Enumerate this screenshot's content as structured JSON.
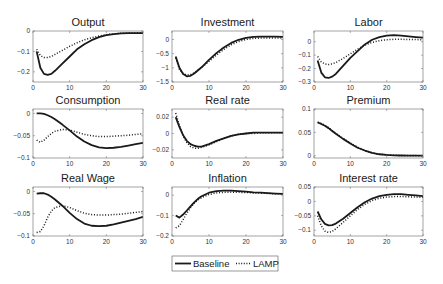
{
  "figure": {
    "legend": {
      "entries": [
        {
          "label": "Baseline",
          "style": "solid"
        },
        {
          "label": "LAMP",
          "style": "dotted"
        }
      ]
    }
  },
  "chart_data": [
    {
      "type": "line",
      "title": "Output",
      "xlabel": "",
      "ylabel": "",
      "xlim": [
        0,
        30
      ],
      "ylim": [
        -0.25,
        0
      ],
      "xticks": [
        0,
        10,
        20,
        30
      ],
      "yticks": [
        0,
        -0.1,
        -0.2
      ],
      "ytick_labels": [
        "0",
        "-0.1",
        "-0.2"
      ],
      "grid": false,
      "x": [
        1,
        2,
        3,
        4,
        5,
        6,
        8,
        10,
        12,
        14,
        16,
        18,
        20,
        22,
        24,
        26,
        28,
        30
      ],
      "series": [
        {
          "name": "Baseline",
          "values": [
            -0.1,
            -0.18,
            -0.21,
            -0.215,
            -0.21,
            -0.195,
            -0.16,
            -0.125,
            -0.09,
            -0.065,
            -0.045,
            -0.03,
            -0.02,
            -0.015,
            -0.012,
            -0.01,
            -0.01,
            -0.01
          ]
        },
        {
          "name": "LAMP",
          "values": [
            -0.09,
            -0.12,
            -0.13,
            -0.13,
            -0.125,
            -0.115,
            -0.095,
            -0.075,
            -0.058,
            -0.043,
            -0.033,
            -0.025,
            -0.018,
            -0.014,
            -0.011,
            -0.01,
            -0.009,
            -0.008
          ]
        }
      ]
    },
    {
      "type": "line",
      "title": "Investment",
      "xlabel": "",
      "ylabel": "",
      "xlim": [
        0,
        30
      ],
      "ylim": [
        -1.5,
        0.3
      ],
      "xticks": [
        0,
        10,
        20,
        30
      ],
      "yticks": [
        0,
        -0.5,
        -1,
        -1.5
      ],
      "ytick_labels": [
        "0",
        "-0.5",
        "-1",
        "-1.5"
      ],
      "grid": false,
      "x": [
        1,
        2,
        3,
        4,
        5,
        6,
        8,
        10,
        12,
        14,
        16,
        18,
        20,
        22,
        24,
        26,
        28,
        30
      ],
      "series": [
        {
          "name": "Baseline",
          "values": [
            -0.6,
            -1.0,
            -1.22,
            -1.3,
            -1.28,
            -1.2,
            -0.98,
            -0.72,
            -0.48,
            -0.28,
            -0.12,
            -0.01,
            0.06,
            0.09,
            0.1,
            0.1,
            0.1,
            0.09
          ]
        },
        {
          "name": "LAMP",
          "values": [
            -0.65,
            -1.05,
            -1.2,
            -1.25,
            -1.24,
            -1.18,
            -0.99,
            -0.77,
            -0.55,
            -0.35,
            -0.19,
            -0.07,
            0.0,
            0.04,
            0.05,
            0.05,
            0.05,
            0.05
          ]
        }
      ]
    },
    {
      "type": "line",
      "title": "Labor",
      "xlabel": "",
      "ylabel": "",
      "xlim": [
        0,
        30
      ],
      "ylim": [
        -0.3,
        0.08
      ],
      "xticks": [
        0,
        10,
        20,
        30
      ],
      "yticks": [
        0,
        -0.1,
        -0.2,
        -0.3
      ],
      "ytick_labels": [
        "0",
        "-0.1",
        "-0.2",
        "-0.3"
      ],
      "grid": false,
      "x": [
        1,
        2,
        3,
        4,
        5,
        6,
        8,
        10,
        12,
        14,
        16,
        18,
        20,
        22,
        24,
        26,
        28,
        30
      ],
      "series": [
        {
          "name": "Baseline",
          "values": [
            -0.14,
            -0.23,
            -0.265,
            -0.27,
            -0.26,
            -0.24,
            -0.18,
            -0.12,
            -0.07,
            -0.02,
            0.015,
            0.035,
            0.045,
            0.05,
            0.045,
            0.04,
            0.035,
            0.03
          ]
        },
        {
          "name": "LAMP",
          "values": [
            -0.11,
            -0.15,
            -0.165,
            -0.17,
            -0.165,
            -0.155,
            -0.125,
            -0.09,
            -0.055,
            -0.025,
            -0.005,
            0.008,
            0.015,
            0.018,
            0.018,
            0.017,
            0.016,
            0.015
          ]
        }
      ]
    },
    {
      "type": "line",
      "title": "Consumption",
      "xlabel": "",
      "ylabel": "",
      "xlim": [
        0,
        30
      ],
      "ylim": [
        -0.1,
        0.01
      ],
      "xticks": [
        0,
        10,
        20,
        30
      ],
      "yticks": [
        0,
        -0.05,
        -0.1
      ],
      "ytick_labels": [
        "0",
        "-0.05",
        "-0.1"
      ],
      "grid": false,
      "x": [
        1,
        2,
        3,
        4,
        5,
        6,
        8,
        10,
        12,
        14,
        16,
        18,
        20,
        22,
        24,
        26,
        28,
        30
      ],
      "series": [
        {
          "name": "Baseline",
          "values": [
            0.0,
            0.0,
            -0.001,
            -0.004,
            -0.008,
            -0.013,
            -0.025,
            -0.038,
            -0.052,
            -0.063,
            -0.071,
            -0.076,
            -0.078,
            -0.077,
            -0.075,
            -0.072,
            -0.069,
            -0.066
          ]
        },
        {
          "name": "LAMP",
          "values": [
            -0.06,
            -0.065,
            -0.06,
            -0.052,
            -0.045,
            -0.04,
            -0.036,
            -0.037,
            -0.042,
            -0.047,
            -0.05,
            -0.052,
            -0.052,
            -0.051,
            -0.05,
            -0.049,
            -0.047,
            -0.046
          ]
        }
      ]
    },
    {
      "type": "line",
      "title": "Real rate",
      "xlabel": "",
      "ylabel": "",
      "xlim": [
        0,
        30
      ],
      "ylim": [
        -0.03,
        0.03
      ],
      "xticks": [
        0,
        10,
        20,
        30
      ],
      "yticks": [
        0.02,
        0,
        -0.02
      ],
      "ytick_labels": [
        "0.02",
        "0",
        "-0.02"
      ],
      "grid": false,
      "x": [
        1,
        2,
        3,
        4,
        5,
        6,
        7,
        8,
        10,
        12,
        14,
        16,
        18,
        20,
        22,
        24,
        26,
        28,
        30
      ],
      "series": [
        {
          "name": "Baseline",
          "values": [
            0.02,
            0.008,
            -0.002,
            -0.009,
            -0.013,
            -0.015,
            -0.016,
            -0.016,
            -0.013,
            -0.009,
            -0.006,
            -0.003,
            -0.001,
            0.0,
            0.001,
            0.001,
            0.001,
            0.001,
            0.001
          ]
        },
        {
          "name": "LAMP",
          "values": [
            0.025,
            0.01,
            -0.003,
            -0.011,
            -0.016,
            -0.018,
            -0.018,
            -0.017,
            -0.014,
            -0.01,
            -0.006,
            -0.003,
            -0.001,
            0.0,
            0.0,
            0.001,
            0.001,
            0.001,
            0.001
          ]
        }
      ]
    },
    {
      "type": "line",
      "title": "Premium",
      "xlabel": "",
      "ylabel": "",
      "xlim": [
        0,
        30
      ],
      "ylim": [
        -0.005,
        0.1
      ],
      "xticks": [
        0,
        10,
        20,
        30
      ],
      "yticks": [
        0.1,
        0.05,
        0
      ],
      "ytick_labels": [
        "0.1",
        "0.05",
        "0"
      ],
      "grid": false,
      "x": [
        1,
        2,
        3,
        4,
        5,
        6,
        8,
        10,
        12,
        14,
        16,
        18,
        20,
        22,
        24,
        26,
        28,
        30
      ],
      "series": [
        {
          "name": "Baseline",
          "values": [
            0.071,
            0.068,
            0.064,
            0.059,
            0.053,
            0.047,
            0.036,
            0.026,
            0.017,
            0.011,
            0.006,
            0.003,
            0.0015,
            0.0008,
            0.0004,
            0.0002,
            0.0001,
            0.0
          ]
        },
        {
          "name": "LAMP",
          "values": [
            0.072,
            0.069,
            0.065,
            0.06,
            0.054,
            0.048,
            0.037,
            0.027,
            0.018,
            0.011,
            0.006,
            0.003,
            0.0015,
            0.0008,
            0.0004,
            0.0002,
            0.0001,
            0.0
          ]
        }
      ]
    },
    {
      "type": "line",
      "title": "Real Wage",
      "xlabel": "",
      "ylabel": "",
      "xlim": [
        0,
        30
      ],
      "ylim": [
        -0.1,
        0.01
      ],
      "xticks": [
        0,
        10,
        20,
        30
      ],
      "yticks": [
        0,
        -0.05,
        -0.1
      ],
      "ytick_labels": [
        "0",
        "-0.05",
        "-0.1"
      ],
      "grid": false,
      "x": [
        1,
        2,
        3,
        4,
        5,
        6,
        8,
        10,
        12,
        14,
        16,
        18,
        20,
        22,
        24,
        26,
        28,
        30
      ],
      "series": [
        {
          "name": "Baseline",
          "values": [
            -0.005,
            -0.004,
            -0.004,
            -0.007,
            -0.012,
            -0.018,
            -0.032,
            -0.048,
            -0.062,
            -0.072,
            -0.077,
            -0.078,
            -0.077,
            -0.074,
            -0.07,
            -0.066,
            -0.062,
            -0.057
          ]
        },
        {
          "name": "LAMP",
          "values": [
            -0.092,
            -0.09,
            -0.077,
            -0.058,
            -0.044,
            -0.036,
            -0.032,
            -0.036,
            -0.043,
            -0.049,
            -0.052,
            -0.053,
            -0.053,
            -0.052,
            -0.051,
            -0.049,
            -0.047,
            -0.045
          ]
        }
      ]
    },
    {
      "type": "line",
      "title": "Inflation",
      "xlabel": "",
      "ylabel": "",
      "xlim": [
        0,
        30
      ],
      "ylim": [
        -0.2,
        0.04
      ],
      "xticks": [
        0,
        10,
        20,
        30
      ],
      "yticks": [
        0,
        -0.1,
        -0.2
      ],
      "ytick_labels": [
        "0",
        "-0.1",
        "-0.2"
      ],
      "grid": false,
      "x": [
        1,
        2,
        3,
        4,
        5,
        6,
        7,
        8,
        10,
        12,
        14,
        16,
        18,
        20,
        22,
        24,
        26,
        28,
        30
      ],
      "series": [
        {
          "name": "Baseline",
          "values": [
            -0.1,
            -0.11,
            -0.095,
            -0.075,
            -0.055,
            -0.035,
            -0.018,
            -0.005,
            0.012,
            0.02,
            0.022,
            0.022,
            0.02,
            0.017,
            0.014,
            0.012,
            0.01,
            0.008,
            0.006
          ]
        },
        {
          "name": "LAMP",
          "values": [
            -0.16,
            -0.15,
            -0.12,
            -0.088,
            -0.062,
            -0.04,
            -0.024,
            -0.012,
            0.003,
            0.011,
            0.014,
            0.015,
            0.014,
            0.013,
            0.011,
            0.01,
            0.008,
            0.007,
            0.006
          ]
        }
      ]
    },
    {
      "type": "line",
      "title": "Interest rate",
      "xlabel": "",
      "ylabel": "",
      "xlim": [
        0,
        30
      ],
      "ylim": [
        -0.12,
        0.05
      ],
      "xticks": [
        0,
        10,
        20,
        30
      ],
      "yticks": [
        0.05,
        0,
        -0.05,
        -0.1
      ],
      "ytick_labels": [
        "0.05",
        "0",
        "-0.05",
        "-0.1"
      ],
      "grid": false,
      "x": [
        1,
        2,
        3,
        4,
        5,
        6,
        8,
        10,
        12,
        14,
        16,
        18,
        20,
        22,
        24,
        26,
        28,
        30
      ],
      "series": [
        {
          "name": "Baseline",
          "values": [
            -0.035,
            -0.062,
            -0.078,
            -0.083,
            -0.082,
            -0.077,
            -0.06,
            -0.04,
            -0.02,
            -0.003,
            0.01,
            0.018,
            0.023,
            0.025,
            0.025,
            0.023,
            0.021,
            0.018
          ]
        },
        {
          "name": "LAMP",
          "values": [
            -0.05,
            -0.085,
            -0.103,
            -0.108,
            -0.104,
            -0.095,
            -0.073,
            -0.05,
            -0.028,
            -0.01,
            0.003,
            0.011,
            0.015,
            0.017,
            0.017,
            0.016,
            0.015,
            0.014
          ]
        }
      ]
    }
  ]
}
